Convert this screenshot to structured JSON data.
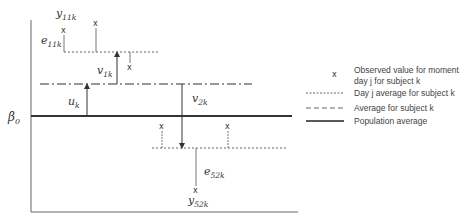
{
  "diagram": {
    "title": "",
    "y_axis_label": "β0",
    "population_average_label": "β0",
    "labels": {
      "y11k": {
        "base": "y",
        "sub": "11k"
      },
      "e11k": {
        "base": "e",
        "sub": "11k"
      },
      "v1k": {
        "base": "v",
        "sub": "1k"
      },
      "uk": {
        "base": "u",
        "sub": "k"
      },
      "v2k": {
        "base": "v",
        "sub": "2k"
      },
      "e52k": {
        "base": "e",
        "sub": "52k"
      },
      "y52k": {
        "base": "y",
        "sub": "52k"
      }
    },
    "marker_glyph": "x",
    "legend": [
      {
        "symbol": "x",
        "line1": "Observed value for moment",
        "line2": "day j for subject k",
        "style": "marker"
      },
      {
        "symbol": "dotted",
        "line1": "Day j average for subject k",
        "style": "dotted"
      },
      {
        "symbol": "dash-dot",
        "line1": "Average for subject k",
        "style": "dashed"
      },
      {
        "symbol": "solid",
        "line1": "Population average",
        "style": "solid"
      }
    ],
    "colors": {
      "axis": "#555555",
      "line": "#333333",
      "text": "#333333",
      "background": "#ffffff"
    }
  }
}
